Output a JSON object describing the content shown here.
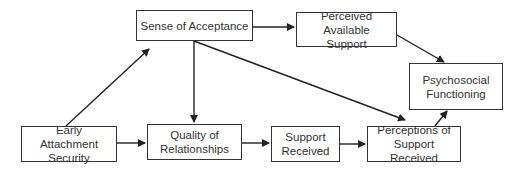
{
  "diagram": {
    "type": "path-model",
    "nodes": [
      {
        "id": "sense_of_acceptance",
        "label": "Sense of Acceptance"
      },
      {
        "id": "perceived_available_support",
        "label": "Perceived Available Support"
      },
      {
        "id": "psychosocial_functioning",
        "label": "Psychosocial Functioning"
      },
      {
        "id": "early_attachment_security",
        "label": "Early Attachment Security"
      },
      {
        "id": "quality_of_relationships",
        "label": "Quality of Relationships"
      },
      {
        "id": "support_received",
        "label": "Support Received"
      },
      {
        "id": "perceptions_of_support_received",
        "label": "Perceptions of Support Received"
      }
    ],
    "edges": [
      {
        "from": "early_attachment_security",
        "to": "sense_of_acceptance"
      },
      {
        "from": "early_attachment_security",
        "to": "quality_of_relationships"
      },
      {
        "from": "sense_of_acceptance",
        "to": "perceived_available_support"
      },
      {
        "from": "sense_of_acceptance",
        "to": "quality_of_relationships"
      },
      {
        "from": "sense_of_acceptance",
        "to": "perceptions_of_support_received"
      },
      {
        "from": "perceived_available_support",
        "to": "psychosocial_functioning"
      },
      {
        "from": "quality_of_relationships",
        "to": "support_received"
      },
      {
        "from": "support_received",
        "to": "perceptions_of_support_received"
      },
      {
        "from": "perceptions_of_support_received",
        "to": "psychosocial_functioning"
      }
    ],
    "colors": {
      "stroke": "#333333",
      "background": "#ffffff"
    }
  }
}
